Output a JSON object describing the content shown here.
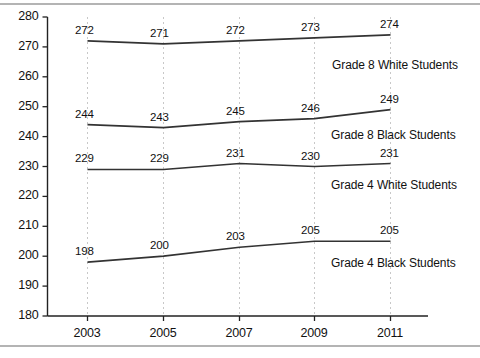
{
  "chart_data": {
    "type": "line",
    "title": "",
    "subtitle": "",
    "xlabel": "",
    "ylabel": "",
    "categories": [
      "2003",
      "2005",
      "2007",
      "2009",
      "2011"
    ],
    "x": [
      2003,
      2005,
      2007,
      2009,
      2011
    ],
    "ylim": [
      180,
      280
    ],
    "ytick_labels": [
      "180",
      "190",
      "200",
      "210",
      "220",
      "230",
      "240",
      "250",
      "260",
      "270",
      "280"
    ],
    "ytick_values": [
      180,
      190,
      200,
      210,
      220,
      230,
      240,
      250,
      260,
      270,
      280
    ],
    "grid": "vertical-dotted-at-each-year",
    "legend_position": "inline-right-under-each-series",
    "line_color": "#333333",
    "grid_color": "#c8c8c8",
    "axis_color": "#222222",
    "series": [
      {
        "name": "Grade 8 White Students",
        "values": [
          272,
          271,
          272,
          273,
          274
        ],
        "labels": [
          "272",
          "271",
          "272",
          "273",
          "274"
        ]
      },
      {
        "name": "Grade 8 Black Students",
        "values": [
          244,
          243,
          245,
          246,
          249
        ],
        "labels": [
          "244",
          "243",
          "245",
          "246",
          "249"
        ]
      },
      {
        "name": "Grade 4 White Students",
        "values": [
          229,
          229,
          231,
          230,
          231
        ],
        "labels": [
          "229",
          "229",
          "231",
          "230",
          "231"
        ]
      },
      {
        "name": "Grade 4 Black Students",
        "values": [
          198,
          200,
          203,
          205,
          205
        ],
        "labels": [
          "198",
          "200",
          "203",
          "205",
          "205"
        ]
      }
    ]
  },
  "axis": {
    "y_ticks": [
      "280",
      "270",
      "260",
      "250",
      "240",
      "230",
      "220",
      "210",
      "200",
      "190",
      "180"
    ],
    "x_ticks": [
      "2003",
      "2005",
      "2007",
      "2009",
      "2011"
    ]
  },
  "series_names": {
    "s0": "Grade 8 White Students",
    "s1": "Grade 8 Black Students",
    "s2": "Grade 4 White Students",
    "s3": "Grade 4 Black Students"
  }
}
